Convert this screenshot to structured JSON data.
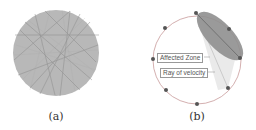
{
  "panels": [
    {
      "id": "a",
      "caption": "(a)"
    },
    {
      "id": "b",
      "caption": "(b)",
      "labels": {
        "affected_zone": "Affected Zone",
        "ray_of_velocity": "Ray of velocity"
      }
    }
  ],
  "colors": {
    "disk_fill": "#b4b4b4",
    "ellipse_fill": "#8f8f8f",
    "circle_stroke": "#b07a7a",
    "node": "#555555"
  }
}
